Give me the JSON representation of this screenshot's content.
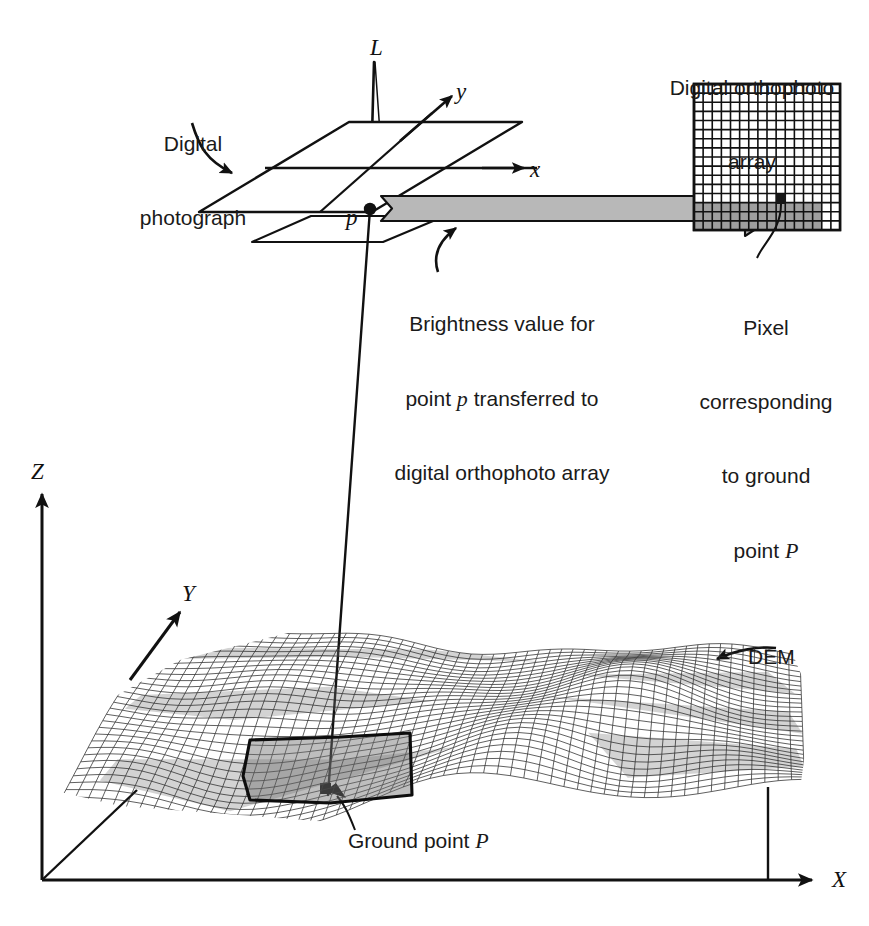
{
  "figure": {
    "width": 869,
    "height": 926,
    "background_color": "#ffffff",
    "ink_color": "#111111",
    "gray_arrow_fill": "#b8b8b8",
    "gray_shade_fill": "#9a9a9a",
    "highlight_patch_color": "#7d7d7d"
  },
  "labels": {
    "digital_photograph": {
      "line1": "Digital",
      "line2": "photograph"
    },
    "orthophoto_array": {
      "line1": "Digital orthophoto",
      "line2": "array"
    },
    "brightness_note": {
      "line1_a": "Brightness value for",
      "line2_a": "point ",
      "line2_italic": "p",
      "line2_b": " transferred to",
      "line3": "digital orthophoto array"
    },
    "pixel_note": {
      "line1": "Pixel",
      "line2": "corresponding",
      "line3": "to ground",
      "line4_a": "point ",
      "line4_italic": "P"
    },
    "ground_point": {
      "text": "Ground point ",
      "italic": "P"
    },
    "dem": "DEM"
  },
  "axes": {
    "photo_axis_x": "x",
    "photo_axis_y": "y",
    "exposure_station": "L",
    "image_point": "p",
    "ground_axis_X": "X",
    "ground_axis_Y": "Y",
    "ground_axis_Z": "Z"
  },
  "orthophoto_grid": {
    "columns": 16,
    "rows": 16,
    "cell_color_light": "#ffffff",
    "cell_color_shaded": "#9e9e9e",
    "target_pixel_color": "#1a1a1a",
    "shaded_rows_from": 13,
    "target_pixel_column": 9,
    "target_pixel_row": 12
  },
  "chart_data": {
    "type": "diagram",
    "elements": [
      "digital photograph plane with x and y photo axes",
      "exposure station L above the photograph",
      "image point p on the photograph",
      "gray transfer arrow from p to the orthophoto array",
      "16 by 16 digital orthophoto array with one dark target pixel",
      "DEM wireframe terrain surface",
      "ground point P under the highlighted DEM patch",
      "ground coordinate axes X, Y and Z"
    ]
  }
}
